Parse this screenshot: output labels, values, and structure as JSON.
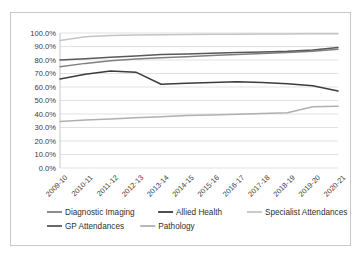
{
  "chart_data": {
    "type": "line",
    "title": "",
    "subtitle": "",
    "xlabel": "",
    "ylabel": "",
    "ylim": [
      0,
      1.0
    ],
    "y_tick_labels": [
      "0.0%",
      "10.0%",
      "20.0%",
      "30.0%",
      "40.0%",
      "50.0%",
      "60.0%",
      "70.0%",
      "80.0%",
      "90.0%",
      "100.0%"
    ],
    "y_tick_values": [
      0,
      10,
      20,
      30,
      40,
      50,
      60,
      70,
      80,
      90,
      100
    ],
    "grid": "horizontal",
    "legend_position": "bottom",
    "categories": [
      "2009-10",
      "2010-11",
      "2011-12",
      "2012-13",
      "2013-14",
      "2014-15",
      "2015-16",
      "2016-17",
      "2017-18",
      "2018-19",
      "2019-20",
      "2020-21"
    ],
    "series": [
      {
        "name": "Diagnostic Imaging",
        "color": "#808080",
        "values": [
          75.0,
          77.5,
          79.5,
          80.8,
          81.7,
          82.5,
          83.3,
          84.0,
          84.8,
          85.5,
          86.5,
          88.0
        ]
      },
      {
        "name": "Allied Health",
        "color": "#3c3c3c",
        "values": [
          66.0,
          69.5,
          71.8,
          71.0,
          62.0,
          62.8,
          63.3,
          63.8,
          63.3,
          62.5,
          61.0,
          57.0
        ]
      },
      {
        "name": "Specialist Attendances",
        "color": "#c4c4c4",
        "values": [
          94.5,
          97.3,
          98.2,
          98.5,
          98.7,
          98.9,
          99.0,
          99.1,
          99.2,
          99.3,
          99.4,
          99.5
        ]
      },
      {
        "name": "GP Attendances",
        "color": "#595959",
        "values": [
          80.0,
          81.0,
          82.0,
          83.0,
          84.0,
          84.5,
          85.0,
          85.5,
          86.0,
          86.5,
          87.5,
          89.3
        ]
      },
      {
        "name": "Pathology",
        "color": "#b0b0b0",
        "values": [
          34.5,
          35.5,
          36.3,
          37.2,
          38.0,
          38.8,
          39.3,
          39.8,
          40.3,
          41.0,
          45.3,
          45.7
        ]
      }
    ]
  },
  "legend": {
    "row1": [
      {
        "label": "Diagnostic Imaging",
        "color": "#808080"
      },
      {
        "label": "Allied Health",
        "color": "#3c3c3c"
      },
      {
        "label": "Specialist Attendances",
        "color": "#c4c4c4"
      }
    ],
    "row2": [
      {
        "label": "GP Attendances",
        "color": "#595959"
      },
      {
        "label": "Pathology",
        "color": "#b0b0b0"
      }
    ]
  }
}
